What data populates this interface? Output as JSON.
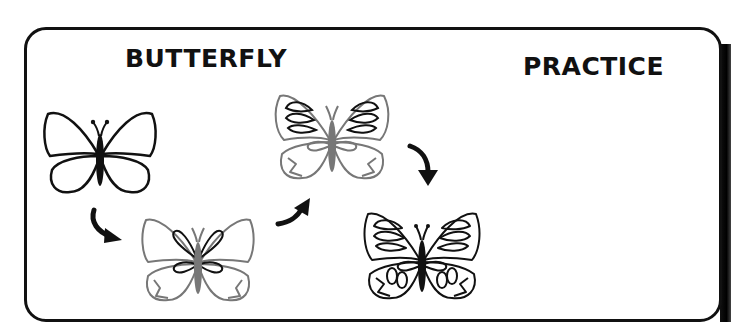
{
  "titles": {
    "left": "BUTTERFLY",
    "right": "PRACTICE"
  },
  "steps": [
    {
      "step": 1,
      "icon": "butterfly-outline-icon"
    },
    {
      "step": 2,
      "icon": "butterfly-inner-loops-icon"
    },
    {
      "step": 3,
      "icon": "butterfly-upper-detail-icon"
    },
    {
      "step": 4,
      "icon": "butterfly-complete-icon"
    }
  ],
  "colors": {
    "ink": "#111111",
    "guide": "#777777",
    "background": "#ffffff"
  }
}
